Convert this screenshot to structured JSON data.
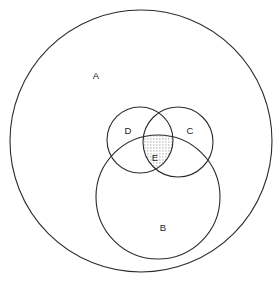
{
  "diagram": {
    "type": "venn-diagram",
    "title": "",
    "background_color": "#ffffff",
    "stroke_color": "#2b2b2b",
    "shade_color": "#9a9a9a",
    "shaded_region_id": "E",
    "sets": [
      {
        "id": "A",
        "label": "A",
        "role": "universal-set",
        "cx": 141,
        "cy": 141,
        "r": 131,
        "label_x": 96,
        "label_y": 76,
        "shaded": false
      },
      {
        "id": "B",
        "label": "B",
        "role": "set",
        "cx": 158,
        "cy": 197,
        "r": 62,
        "label_x": 163,
        "label_y": 228,
        "shaded": false
      },
      {
        "id": "D",
        "label": "D",
        "role": "set",
        "cx": 140,
        "cy": 140,
        "r": 33,
        "label_x": 128,
        "label_y": 131,
        "shaded": false
      },
      {
        "id": "C",
        "label": "C",
        "role": "set",
        "cx": 178,
        "cy": 142,
        "r": 35,
        "label_x": 190,
        "label_y": 131,
        "shaded": false
      }
    ],
    "regions": [
      {
        "id": "E",
        "label": "E",
        "description": "intersection of B, C and D",
        "label_x": 155,
        "label_y": 158,
        "shaded": true,
        "fill_pattern": "dots"
      }
    ]
  }
}
